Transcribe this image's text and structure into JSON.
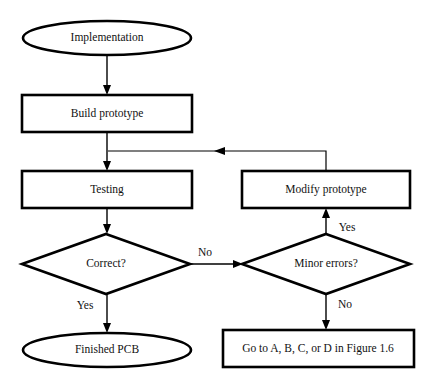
{
  "figure": {
    "type": "flowchart",
    "canvas": {
      "width": 447,
      "height": 388
    },
    "background_color": "#ffffff",
    "line_color": "#000000",
    "text_color": "#111111"
  },
  "nodes": [
    {
      "id": "implementation",
      "label": "Implementation",
      "shape": "ellipse",
      "cx": 107,
      "cy": 38,
      "rx": 84,
      "ry": 17
    },
    {
      "id": "build-prototype",
      "label": "Build prototype",
      "shape": "rect",
      "x": 22,
      "y": 95,
      "width": 170,
      "height": 37
    },
    {
      "id": "testing",
      "label": "Testing",
      "shape": "rect",
      "x": 22,
      "y": 171,
      "width": 170,
      "height": 37
    },
    {
      "id": "modify-prototype",
      "label": "Modify prototype",
      "shape": "rect",
      "x": 242,
      "y": 171,
      "width": 168,
      "height": 37
    },
    {
      "id": "correct-decision",
      "label": "Correct?",
      "shape": "diamond",
      "cx": 106,
      "cy": 264,
      "rx": 84,
      "ry": 30
    },
    {
      "id": "minor-errors-decision",
      "label": "Minor errors?",
      "shape": "diamond",
      "cx": 326,
      "cy": 264,
      "rx": 84,
      "ry": 30
    },
    {
      "id": "finished-pcb",
      "label": "Finished PCB",
      "shape": "ellipse",
      "cx": 107,
      "cy": 350,
      "rx": 84,
      "ry": 17
    },
    {
      "id": "go-to-figure",
      "label": "Go to A, B, C, or D in Figure 1.6",
      "shape": "rect",
      "x": 223,
      "y": 330,
      "width": 191,
      "height": 37
    }
  ],
  "edges": [
    {
      "id": "implementation-to-build",
      "from": "implementation",
      "to": "build-prototype",
      "label": ""
    },
    {
      "id": "build-to-testing",
      "from": "build-prototype",
      "to": "testing",
      "label": ""
    },
    {
      "id": "testing-to-correct",
      "from": "testing",
      "to": "correct-decision",
      "label": ""
    },
    {
      "id": "correct-no-to-minor",
      "from": "correct-decision",
      "to": "minor-errors-decision",
      "label": "No"
    },
    {
      "id": "correct-yes-to-finished",
      "from": "correct-decision",
      "to": "finished-pcb",
      "label": "Yes"
    },
    {
      "id": "minor-yes-to-modify",
      "from": "minor-errors-decision",
      "to": "modify-prototype",
      "label": "Yes"
    },
    {
      "id": "minor-no-to-goto",
      "from": "minor-errors-decision",
      "to": "go-to-figure",
      "label": "No"
    },
    {
      "id": "modify-feedback-to-testing",
      "from": "modify-prototype",
      "to": "testing",
      "label": ""
    }
  ],
  "edge_labels": {
    "correct_no": "No",
    "correct_yes": "Yes",
    "minor_yes": "Yes",
    "minor_no": "No"
  }
}
